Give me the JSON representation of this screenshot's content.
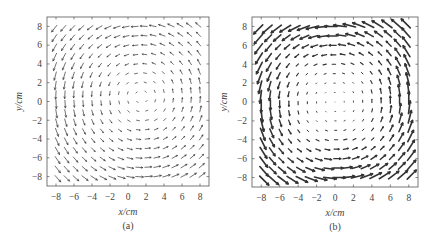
{
  "figure": {
    "panels": [
      {
        "id": "a",
        "label": "(a)",
        "xlabel": "x/cm",
        "ylabel": "y/cm"
      },
      {
        "id": "b",
        "label": "(b)",
        "xlabel": "x/cm",
        "ylabel": "y/cm"
      }
    ]
  },
  "chart_data": [
    {
      "type": "quiver",
      "title": "(a)",
      "xlabel": "x/cm",
      "ylabel": "y/cm",
      "xlim": [
        -9,
        9
      ],
      "ylim": [
        -9,
        9
      ],
      "xticks": [
        -8,
        -6,
        -4,
        -2,
        0,
        2,
        4,
        6,
        8
      ],
      "yticks": [
        -8,
        -6,
        -4,
        -2,
        0,
        2,
        4,
        6,
        8
      ],
      "grid": false,
      "grid_points": {
        "x_start": -8,
        "x_end": 8,
        "y_start": -8,
        "y_end": 8,
        "count": 17
      },
      "description": "Weak vortex-like vector field: small arrows, leftward flow near top, downward on left, rightward near bottom, upward/diagonal on right; near-zero magnitudes around center-right",
      "field": {
        "kind": "rotational",
        "strength": 0.45,
        "center": [
          1.5,
          0.5
        ]
      }
    },
    {
      "type": "quiver",
      "title": "(b)",
      "xlabel": "x/cm",
      "ylabel": "y/cm",
      "xlim": [
        -9,
        9
      ],
      "ylim": [
        -9,
        9
      ],
      "xticks": [
        -8,
        -6,
        -4,
        -2,
        0,
        2,
        4,
        6,
        8
      ],
      "yticks": [
        -8,
        -6,
        -4,
        -2,
        0,
        2,
        4,
        6,
        8
      ],
      "grid": false,
      "grid_points": {
        "x_start": -8,
        "x_end": 8,
        "y_start": -8,
        "y_end": 8,
        "count": 17
      },
      "description": "Strong counter-clockwise square vortex: large arrows around the boundary, magnitude decreasing to near zero at center",
      "field": {
        "kind": "rotational",
        "strength": 1.0,
        "center": [
          0,
          0
        ]
      }
    }
  ],
  "caption": {
    "text": ""
  }
}
